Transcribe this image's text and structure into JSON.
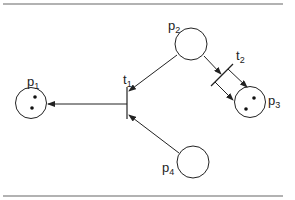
{
  "diagram": {
    "type": "petri-net",
    "places": [
      {
        "id": "p1",
        "label": "p",
        "sub": "1",
        "tokens": 2
      },
      {
        "id": "p2",
        "label": "p",
        "sub": "2",
        "tokens": 0
      },
      {
        "id": "p3",
        "label": "p",
        "sub": "3",
        "tokens": 2
      },
      {
        "id": "p4",
        "label": "p",
        "sub": "4",
        "tokens": 0
      }
    ],
    "transitions": [
      {
        "id": "t1",
        "label": "t",
        "sub": "1"
      },
      {
        "id": "t2",
        "label": "t",
        "sub": "2"
      }
    ],
    "arcs": [
      {
        "from": "p2",
        "to": "t1"
      },
      {
        "from": "p4",
        "to": "t1"
      },
      {
        "from": "t1",
        "to": "p1"
      },
      {
        "from": "p2",
        "to": "t2"
      },
      {
        "from": "t2",
        "to": "p3",
        "count": 2
      }
    ],
    "colors": {
      "stroke": "#222222",
      "rule": "#555555",
      "background": "#ffffff"
    }
  }
}
